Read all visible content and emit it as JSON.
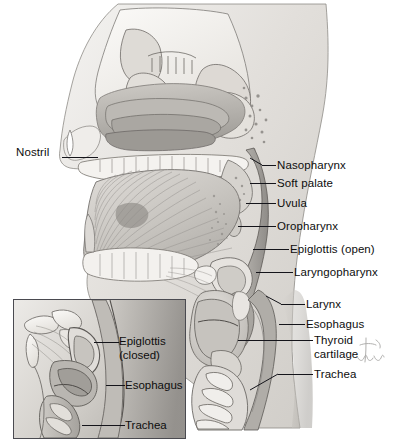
{
  "figure": {
    "background_color": "#ffffff",
    "ink_color": "#14141a",
    "tissue_tone_light": "#e8e6e3",
    "tissue_tone_mid": "#c9c6c2",
    "tissue_tone_dark": "#9b9894",
    "bone_tone": "#f2f1ee"
  },
  "main_labels": [
    {
      "id": "nostril",
      "text": "Nostril",
      "side": "left",
      "text_x": 16,
      "text_y": 146,
      "leader_x": 62,
      "leader_y": 157,
      "leader_w": 36
    },
    {
      "id": "nasopharynx",
      "text": "Nasopharynx",
      "side": "right",
      "text_x": 277,
      "text_y": 159,
      "leader_x": 262,
      "leader_y": 165,
      "leader_w": 14
    },
    {
      "id": "soft-palate",
      "text": "Soft palate",
      "side": "right",
      "text_x": 277,
      "text_y": 177,
      "leader_x": 250,
      "leader_y": 183,
      "leader_w": 26
    },
    {
      "id": "uvula",
      "text": "Uvula",
      "side": "right",
      "text_x": 277,
      "text_y": 197,
      "leader_x": 246,
      "leader_y": 203,
      "leader_w": 30
    },
    {
      "id": "oropharynx",
      "text": "Oropharynx",
      "side": "right",
      "text_x": 277,
      "text_y": 220,
      "leader_x": 238,
      "leader_y": 226,
      "leader_w": 38
    },
    {
      "id": "epiglottis-open",
      "text": "Epiglottis (open)",
      "side": "right",
      "text_x": 290,
      "text_y": 243,
      "leader_x": 253,
      "leader_y": 249,
      "leader_w": 36
    },
    {
      "id": "laryngopharynx",
      "text": "Laryngopharynx",
      "side": "right",
      "text_x": 294,
      "text_y": 266,
      "leader_x": 256,
      "leader_y": 272,
      "leader_w": 37
    },
    {
      "id": "larynx",
      "text": "Larynx",
      "side": "right",
      "text_x": 306,
      "text_y": 298,
      "leader_x": 281,
      "leader_y": 304,
      "leader_w": 24
    },
    {
      "id": "esophagus",
      "text": "Esophagus",
      "side": "right",
      "text_x": 306,
      "text_y": 318,
      "leader_x": 279,
      "leader_y": 324,
      "leader_w": 26
    },
    {
      "id": "thyroid-cartilage",
      "text": "Thyroid\ncartilage",
      "side": "right",
      "text_x": 314,
      "text_y": 334,
      "leader_x": 238,
      "leader_y": 340,
      "leader_w": 75
    },
    {
      "id": "trachea",
      "text": "Trachea",
      "side": "right",
      "text_x": 314,
      "text_y": 368,
      "leader_x": 278,
      "leader_y": 374,
      "leader_w": 35
    }
  ],
  "inset": {
    "border_color": "#4a4a50",
    "labels": [
      {
        "id": "inset-epiglottis-closed",
        "text": "Epiglottis\n(closed)",
        "text_x": 118,
        "text_y": 334,
        "leader_x": 99,
        "leader_y": 341,
        "leader_w": 18
      },
      {
        "id": "inset-esophagus",
        "text": "Esophagus",
        "text_x": 124,
        "text_y": 378,
        "leader_x": 105,
        "leader_y": 384,
        "leader_w": 18
      },
      {
        "id": "inset-trachea",
        "text": "Trachea",
        "text_x": 124,
        "text_y": 418,
        "leader_x": 82,
        "leader_y": 424,
        "leader_w": 41
      }
    ]
  },
  "signature": {
    "present": true,
    "description": "artist-signature"
  }
}
